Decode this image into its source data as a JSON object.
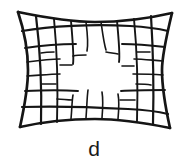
{
  "figure": {
    "caption": "d",
    "colors": {
      "background": "#ffffff",
      "ink": "#151515",
      "caption_text": "#1a1a1a"
    },
    "geometry": {
      "canvas_width": 188,
      "canvas_height": 168,
      "grid_box": {
        "left": 18,
        "top": 12,
        "right": 172,
        "bottom": 128
      },
      "corners": {
        "top_left": [
          18,
          12
        ],
        "top_right": [
          172,
          13
        ],
        "bottom_right": [
          170,
          128
        ],
        "bottom_left": [
          20,
          127
        ]
      },
      "edge_bow": {
        "top_center_y": 22,
        "bottom_center_y": 119,
        "left_center_x": 28,
        "right_center_x": 162
      },
      "distortion_type": "pincushion",
      "columns": 9,
      "rows": 7
    },
    "caption_font_size_px": 21
  }
}
